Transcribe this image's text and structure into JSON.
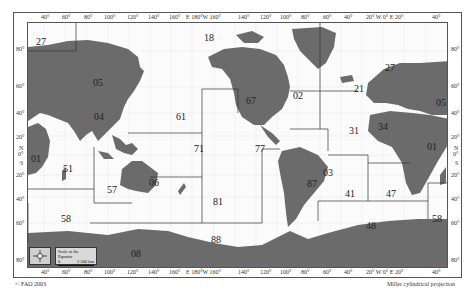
{
  "map": {
    "title": "FAO Major Fishing Areas",
    "projection": "Miller cylindrical projection",
    "copyright": "© FAO 2003",
    "scale": {
      "label": "Scale at the Equator",
      "start": "0",
      "end": "2 500 km"
    },
    "compass": {
      "n": "N",
      "s": "S",
      "e": "E",
      "w": "W"
    },
    "colors": {
      "land": "#6b6b6b",
      "ocean": "#fbfbfb",
      "border": "#444444",
      "frame": "#555555"
    },
    "top_ticks": [
      "40°",
      "60°",
      "80°",
      "100°",
      "120°",
      "140°",
      "160°",
      "E 180°W 160°",
      "140°",
      "120°",
      "100°",
      "80°",
      "60°",
      "40°",
      "20° W  0°  E 20°",
      "40°"
    ],
    "bottom_ticks": [
      "40°",
      "60°",
      "80°",
      "100°",
      "120°",
      "140°",
      "160°",
      "E 180°W 160°",
      "140°",
      "120°",
      "100°",
      "80°",
      "60°",
      "40°",
      "20° W  0°  E 20°",
      "40°"
    ],
    "left_ticks": [
      "80°",
      "60°",
      "40°",
      "20°",
      "N",
      "0°",
      "S",
      "20°",
      "40°",
      "60°",
      "80°"
    ],
    "right_ticks": [
      "80°",
      "60°",
      "40°",
      "20°",
      "N",
      "0°",
      "S",
      "20°",
      "40°",
      "60°",
      "80°"
    ],
    "areas": [
      {
        "code": "27",
        "region": "Atlantic, Northeast (west part)"
      },
      {
        "code": "18",
        "region": "Arctic Sea"
      },
      {
        "code": "27",
        "region": "Atlantic, Northeast"
      },
      {
        "code": "05",
        "region": "Europe (Inland) west"
      },
      {
        "code": "02",
        "region": "America, North (Inland)"
      },
      {
        "code": "21",
        "region": "Atlantic, Northwest"
      },
      {
        "code": "05",
        "region": "Europe (Inland) east"
      },
      {
        "code": "04",
        "region": "Asia (Inland)"
      },
      {
        "code": "67",
        "region": "Pacific, Northeast"
      },
      {
        "code": "61",
        "region": "Pacific, Northwest"
      },
      {
        "code": "31",
        "region": "Atlantic, Western Central"
      },
      {
        "code": "34",
        "region": "Atlantic, Eastern Central"
      },
      {
        "code": "71",
        "region": "Pacific, Western Central"
      },
      {
        "code": "77",
        "region": "Pacific, Eastern Central"
      },
      {
        "code": "01",
        "region": "Africa (Inland) west"
      },
      {
        "code": "01",
        "region": "Africa (Inland) east"
      },
      {
        "code": "51",
        "region": "Indian Ocean, Western (west)"
      },
      {
        "code": "87",
        "region": "Pacific, Southeast"
      },
      {
        "code": "03",
        "region": "America, South (Inland)"
      },
      {
        "code": "41",
        "region": "Atlantic, Southwest"
      },
      {
        "code": "47",
        "region": "Atlantic, Southeast"
      },
      {
        "code": "51",
        "region": "Indian Ocean, Western (east)"
      },
      {
        "code": "57",
        "region": "Indian Ocean, Eastern"
      },
      {
        "code": "06",
        "region": "Oceania (Inland)"
      },
      {
        "code": "81",
        "region": "Pacific, Southwest"
      },
      {
        "code": "58",
        "region": "Indian Ocean, Antarctic (west)"
      },
      {
        "code": "48",
        "region": "Atlantic, Antarctic"
      },
      {
        "code": "58",
        "region": "Indian Ocean, Antarctic (east)"
      },
      {
        "code": "88",
        "region": "Pacific, Antarctic"
      },
      {
        "code": "08",
        "region": "Antarctica (Inland)"
      }
    ]
  }
}
